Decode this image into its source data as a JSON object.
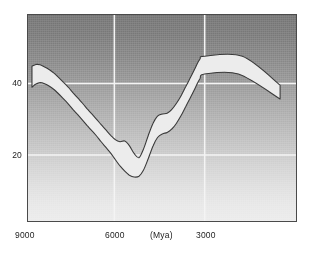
{
  "chart_data": {
    "type": "area",
    "title": "",
    "subtitle": "",
    "xlabel": "(Mya)",
    "ylabel": "",
    "x_axis": {
      "tick_values": [
        9000,
        6000,
        3000
      ],
      "tick_labels": [
        "9000",
        "6000",
        "3000"
      ],
      "unit_label": "(Mya)",
      "direction": "decreasing",
      "range": [
        9120,
        3000
      ],
      "gridlines": [
        6000,
        3000
      ]
    },
    "y_axis": {
      "tick_values": [
        40,
        20
      ],
      "tick_labels": [
        "40",
        "20"
      ],
      "range": [
        2,
        60
      ],
      "gridlines": [
        40,
        20
      ]
    },
    "grid": true,
    "legend": null,
    "series": [
      {
        "name": "upper bound",
        "x": [
          9120,
          8980,
          8830,
          8670,
          8500,
          8330,
          8170,
          8000,
          7830,
          7670,
          7500,
          7330,
          7170,
          7000,
          6830,
          6670,
          6500,
          6330,
          6170,
          6000,
          5830,
          5670,
          5500,
          5330,
          5170,
          5000,
          4830,
          4670,
          4500,
          4330,
          4170,
          4000,
          3830,
          3670,
          3500,
          3330,
          3170,
          3000
        ],
        "values": [
          45.6,
          46.1,
          46.0,
          45.4,
          44.6,
          43.6,
          42.4,
          41.1,
          39.7,
          38.2,
          36.7,
          35.2,
          33.7,
          32.2,
          30.7,
          29.2,
          27.7,
          26.2,
          25.0,
          24.4,
          24.6,
          23.3,
          21.1,
          19.9,
          22.3,
          26.1,
          29.6,
          31.6,
          32.2,
          32.4,
          33.4,
          35.2,
          37.4,
          39.9,
          42.5,
          45.2,
          47.6,
          48.4
        ]
      },
      {
        "name": "lower bound",
        "x": [
          9120,
          8980,
          8830,
          8670,
          8500,
          8330,
          8170,
          8000,
          7830,
          7670,
          7500,
          7330,
          7170,
          7000,
          6830,
          6670,
          6500,
          6330,
          6170,
          6000,
          5830,
          5670,
          5500,
          5330,
          5170,
          5000,
          4830,
          4670,
          4500,
          4330,
          4170,
          4000,
          3830,
          3670,
          3500,
          3330,
          3170,
          3000
        ],
        "values": [
          39.7,
          40.6,
          41.0,
          40.7,
          40.0,
          39.0,
          37.8,
          36.4,
          35.0,
          33.5,
          32.0,
          30.5,
          29.0,
          27.5,
          26.0,
          24.4,
          22.8,
          21.2,
          19.4,
          17.6,
          16.1,
          15.0,
          14.5,
          14.7,
          16.4,
          19.6,
          23.2,
          25.6,
          26.6,
          27.0,
          27.9,
          29.6,
          31.8,
          34.3,
          36.9,
          39.6,
          42.1,
          43.4
        ]
      }
    ],
    "band_tail": {
      "note": "curve continues past last gridline, rises to peak then falls to right edge",
      "peak_value_upper": 48.4,
      "peak_value_lower": 43.4,
      "end_value_upper": 40.3,
      "end_value_lower": 36.4
    },
    "band_fill_color": "#ececec",
    "band_stroke_color": "#3a3a3a",
    "background_gradient": [
      "#767676",
      "#ececec"
    ],
    "gridline_color": "#f2f2f2",
    "frame_color": "#4a4a4a"
  },
  "axis": {
    "y_labels": [
      {
        "text": "40"
      },
      {
        "text": "20"
      }
    ],
    "x_labels": [
      {
        "text": "9000"
      },
      {
        "text": "6000"
      },
      {
        "text": "(Mya)"
      },
      {
        "text": "3000"
      }
    ]
  }
}
